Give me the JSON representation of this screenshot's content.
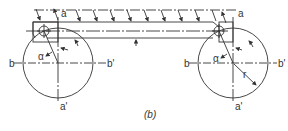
{
  "figure": {
    "caption": "(b)",
    "line_color": "#333333",
    "background": "#ffffff"
  },
  "labels": {
    "left": {
      "a_top": "a",
      "a_bottom": "a'",
      "b_left": "b",
      "b_right": "b'",
      "angle": "α"
    },
    "right": {
      "a_top": "a",
      "a_bottom": "a'",
      "b_left": "b",
      "b_right": "b'",
      "angle": "α",
      "radius": "r"
    }
  }
}
